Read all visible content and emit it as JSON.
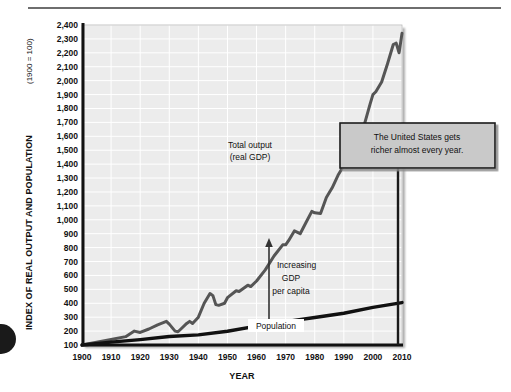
{
  "figure": {
    "decorations": {
      "top_rule": "horizontal-rule",
      "page_bullet": "page-bullet-dot"
    }
  },
  "chart_data": {
    "type": "line",
    "title": "",
    "xlabel": "YEAR",
    "ylabel": "INDEX OF REAL OUTPUT AND POPULATION",
    "ylabel_note": "(1900 = 100)",
    "xlim": [
      1900,
      2010
    ],
    "ylim": [
      100,
      2400
    ],
    "grid": true,
    "legend_position": "inline-annotations",
    "xticks": [
      "1900",
      "1910",
      "1920",
      "1930",
      "1940",
      "1950",
      "1960",
      "1970",
      "1980",
      "1990",
      "2000",
      "2010"
    ],
    "yticks": [
      "100",
      "200",
      "300",
      "400",
      "500",
      "600",
      "700",
      "800",
      "900",
      "1,000",
      "1,100",
      "1,200",
      "1,300",
      "1,400",
      "1,500",
      "1,600",
      "1,700",
      "1,800",
      "1,900",
      "2,000",
      "2,100",
      "2,200",
      "2,300",
      "2,400"
    ],
    "series": [
      {
        "name": "Total output (real GDP)",
        "label_line1": "Total output",
        "label_line2": "(real GDP)",
        "color": "#555555",
        "x": [
          1900,
          1905,
          1910,
          1915,
          1918,
          1920,
          1923,
          1926,
          1929,
          1930,
          1931,
          1932,
          1933,
          1934,
          1936,
          1937,
          1938,
          1940,
          1942,
          1944,
          1945,
          1946,
          1947,
          1949,
          1950,
          1953,
          1954,
          1957,
          1958,
          1960,
          1963,
          1966,
          1969,
          1970,
          1971,
          1973,
          1975,
          1977,
          1979,
          1980,
          1982,
          1984,
          1986,
          1988,
          1990,
          1991,
          1993,
          1995,
          1997,
          1999,
          2000,
          2001,
          2003,
          2005,
          2007,
          2008,
          2009,
          2010
        ],
        "y": [
          100,
          120,
          140,
          160,
          200,
          190,
          215,
          245,
          270,
          250,
          225,
          200,
          195,
          215,
          255,
          270,
          255,
          300,
          400,
          470,
          455,
          390,
          385,
          400,
          440,
          490,
          485,
          530,
          520,
          560,
          640,
          740,
          820,
          820,
          850,
          920,
          900,
          980,
          1060,
          1050,
          1045,
          1160,
          1230,
          1320,
          1390,
          1380,
          1450,
          1530,
          1680,
          1830,
          1900,
          1920,
          1990,
          2120,
          2260,
          2270,
          2200,
          2340
        ]
      },
      {
        "name": "Population",
        "label": "Population",
        "color": "#111111",
        "x": [
          1900,
          1910,
          1920,
          1930,
          1940,
          1950,
          1960,
          1970,
          1980,
          1990,
          2000,
          2010
        ],
        "y": [
          100,
          121,
          139,
          161,
          173,
          199,
          236,
          268,
          298,
          328,
          370,
          405
        ]
      }
    ],
    "annotations": [
      {
        "id": "increasing-gdp-per-capita",
        "line1": "Increasing",
        "line2": "GDP",
        "line3": "per capita",
        "arrow": "double-headed-vertical",
        "at_year": 1970,
        "from_value": 820,
        "to_value": 268
      },
      {
        "id": "callout-box",
        "line1": "The United States gets",
        "line2": "richer almost every year.",
        "background": "#c9c9c9",
        "border": "#1a1a1a"
      }
    ]
  }
}
